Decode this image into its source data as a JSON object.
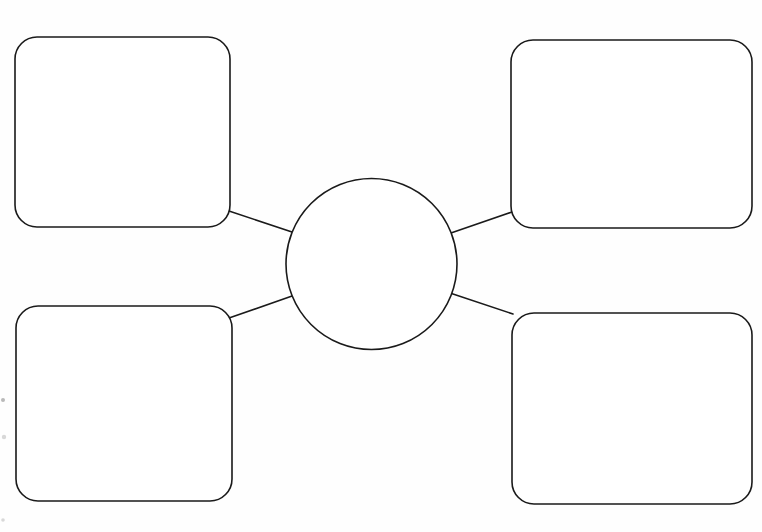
{
  "document": {
    "title": "Concept Map Worksheet",
    "kind": "blank-graphic-organizer",
    "width": 762,
    "height": 532,
    "background_color": "#fefefe",
    "ink_color": "#1a1a1a",
    "stroke_width": 1.6,
    "notes": "Hand-drawn / photocopied blank concept-map organizer: one empty center circle joined by four straight lines to four empty rounded rectangles at the corners. No printed text anywhere on the sheet."
  },
  "hub": {
    "id": "center-circle",
    "shape": "circle",
    "label": "",
    "cx": 371.5,
    "cy": 264,
    "r": 85.5
  },
  "nodes": [
    {
      "id": "node-top-left",
      "position": "top-left",
      "shape": "rounded-rectangle",
      "label": "",
      "x": 15,
      "y": 37,
      "width": 215,
      "height": 190,
      "rx": 22
    },
    {
      "id": "node-top-right",
      "position": "top-right",
      "shape": "rounded-rectangle",
      "label": "",
      "x": 511,
      "y": 40,
      "width": 241,
      "height": 188,
      "rx": 22
    },
    {
      "id": "node-bottom-left",
      "position": "bottom-left",
      "shape": "rounded-rectangle",
      "label": "",
      "x": 16,
      "y": 306,
      "width": 216,
      "height": 195,
      "rx": 22
    },
    {
      "id": "node-bottom-right",
      "position": "bottom-right",
      "shape": "rounded-rectangle",
      "label": "",
      "x": 512,
      "y": 313,
      "width": 240,
      "height": 191,
      "rx": 22
    }
  ],
  "connectors": [
    {
      "id": "connector-top-left",
      "from": "node-top-left",
      "to": "center-circle",
      "label": "",
      "x1": 229,
      "y1": 211,
      "x2": 293.5,
      "y2": 232.5
    },
    {
      "id": "connector-top-right",
      "from": "node-top-right",
      "to": "center-circle",
      "label": "",
      "x1": 512,
      "y1": 212,
      "x2": 449.5,
      "y2": 233.5
    },
    {
      "id": "connector-bottom-left",
      "from": "node-bottom-left",
      "to": "center-circle",
      "label": "",
      "x1": 229,
      "y1": 318,
      "x2": 293.5,
      "y2": 295.5
    },
    {
      "id": "connector-bottom-right",
      "from": "node-bottom-right",
      "to": "center-circle",
      "label": "",
      "x1": 513,
      "y1": 314,
      "x2": 450,
      "y2": 293
    }
  ],
  "artifacts": [
    {
      "id": "speck-1",
      "cx": 3,
      "cy": 400,
      "r": 2.0,
      "faint": false
    },
    {
      "id": "speck-2",
      "cx": 4,
      "cy": 437,
      "r": 2.2,
      "faint": true
    },
    {
      "id": "speck-3",
      "cx": 3,
      "cy": 520,
      "r": 1.8,
      "faint": true
    }
  ]
}
